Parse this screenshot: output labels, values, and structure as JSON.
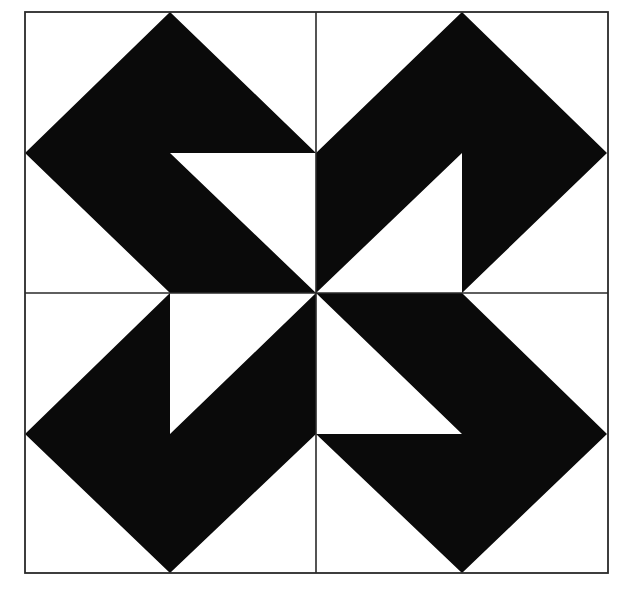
{
  "figure": {
    "kind": "quilt-block-pattern",
    "width": 620,
    "height": 592,
    "colors": {
      "background": "#ffffff",
      "fill": "#0a0a0a",
      "line": "#2a2a2a"
    },
    "frame": {
      "x1": 25,
      "y1": 12,
      "x2": 608,
      "y2": 573
    },
    "center": {
      "x": 316,
      "y": 293
    },
    "quadrants": [
      {
        "name": "top-left",
        "points": "170,12 316,153 170,153 316,293 170,293 25,153"
      },
      {
        "name": "top-right",
        "points": "462,12 607,153 462,293 462,153 316,293 316,153"
      },
      {
        "name": "bottom-left",
        "points": "170,293 170,434 316,293 316,434 170,573 25,434"
      },
      {
        "name": "bottom-right",
        "points": "316,293 462,293 607,434 462,573 316,434 462,434"
      }
    ]
  }
}
